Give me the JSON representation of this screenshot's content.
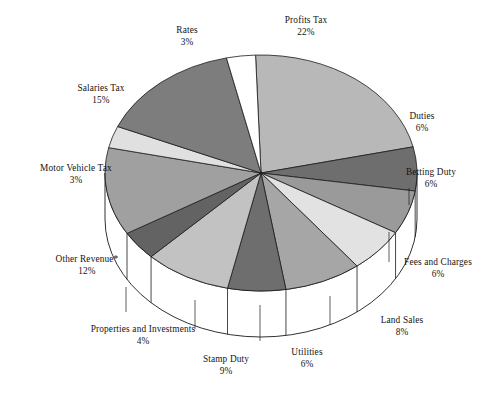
{
  "chart_data": {
    "type": "pie",
    "title": "",
    "subtitle": "",
    "xlabel": "",
    "ylabel": "",
    "legend": "none",
    "grid": false,
    "style": "3d-pie-with-side-wall",
    "value_unit": "percent",
    "footnote_marker": "*",
    "categories": [
      "Profits Tax",
      "Duties",
      "Betting Duty",
      "Fees and Charges",
      "Land Sales",
      "Utilities",
      "Stamp Duty",
      "Properties and Investments",
      "Other Revenue*",
      "Motor Vehicle Tax",
      "Salaries Tax",
      "Rates"
    ],
    "values": [
      22,
      6,
      6,
      6,
      8,
      6,
      9,
      4,
      12,
      3,
      15,
      3
    ],
    "value_labels": [
      "22%",
      "6%",
      "6%",
      "6%",
      "8%",
      "6%",
      "9%",
      "4%",
      "12%",
      "3%",
      "15%",
      "3%"
    ],
    "colors": [
      "#b8b8b8",
      "#6e6e6e",
      "#9a9a9a",
      "#e2e2e2",
      "#a6a6a6",
      "#6e6e6e",
      "#c2c2c2",
      "#636363",
      "#a0a0a0",
      "#e0e0e0",
      "#7d7d7d",
      "#ffffff"
    ],
    "slices": [
      {
        "label": "Profits Tax",
        "value": 22,
        "value_label": "22%",
        "color": "#b8b8b8"
      },
      {
        "label": "Duties",
        "value": 6,
        "value_label": "6%",
        "color": "#6e6e6e"
      },
      {
        "label": "Betting Duty",
        "value": 6,
        "value_label": "6%",
        "color": "#9a9a9a"
      },
      {
        "label": "Fees and Charges",
        "value": 6,
        "value_label": "6%",
        "color": "#e2e2e2"
      },
      {
        "label": "Land Sales",
        "value": 8,
        "value_label": "8%",
        "color": "#a6a6a6"
      },
      {
        "label": "Utilities",
        "value": 6,
        "value_label": "6%",
        "color": "#6e6e6e"
      },
      {
        "label": "Stamp Duty",
        "value": 9,
        "value_label": "9%",
        "color": "#c2c2c2"
      },
      {
        "label": "Properties and Investments",
        "value": 4,
        "value_label": "4%",
        "color": "#636363"
      },
      {
        "label": "Other Revenue*",
        "value": 12,
        "value_label": "12%",
        "color": "#a0a0a0"
      },
      {
        "label": "Motor Vehicle Tax",
        "value": 3,
        "value_label": "3%",
        "color": "#e0e0e0"
      },
      {
        "label": "Salaries Tax",
        "value": 15,
        "value_label": "15%",
        "color": "#7d7d7d"
      },
      {
        "label": "Rates",
        "value": 3,
        "value_label": "3%",
        "color": "#ffffff"
      }
    ]
  },
  "labels": {
    "profits_tax": {
      "name": "Profits Tax",
      "pct": "22%"
    },
    "duties": {
      "name": "Duties",
      "pct": "6%"
    },
    "betting_duty": {
      "name": "Betting Duty",
      "pct": "6%"
    },
    "fees_and_charges": {
      "name": "Fees and Charges",
      "pct": "6%"
    },
    "land_sales": {
      "name": "Land Sales",
      "pct": "8%"
    },
    "utilities": {
      "name": "Utilities",
      "pct": "6%"
    },
    "stamp_duty": {
      "name": "Stamp Duty",
      "pct": "9%"
    },
    "properties": {
      "name": "Properties and Investments",
      "pct": "4%"
    },
    "other_revenue": {
      "name": "Other Revenue*",
      "pct": "12%"
    },
    "motor_vehicle": {
      "name": "Motor Vehicle Tax",
      "pct": "3%"
    },
    "salaries_tax": {
      "name": "Salaries Tax",
      "pct": "15%"
    },
    "rates": {
      "name": "Rates",
      "pct": "3%"
    }
  },
  "palette": {
    "background": "#ffffff",
    "outline": "#1a1a1a",
    "text": "#141414",
    "side_wall": "#ffffff"
  }
}
